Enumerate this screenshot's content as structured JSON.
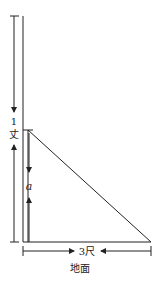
{
  "diagram": {
    "type": "geometry-word-problem",
    "labels": {
      "total_height_number": "1",
      "total_height_unit": "丈",
      "remaining_height": "a",
      "base_distance": "3尺",
      "ground": "地面"
    },
    "line_color": "#222222"
  }
}
